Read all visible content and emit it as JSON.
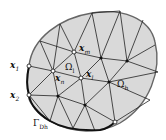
{
  "diagram": {
    "type": "finite-element-triangulation",
    "colors": {
      "fill": "#d9d9d9",
      "edge": "#222222",
      "boundary_outer": "#555555",
      "boundary_dirichlet": "#111111"
    },
    "labels": {
      "x1": {
        "base": "x",
        "sub": "1"
      },
      "x2": {
        "base": "x",
        "sub": "2"
      },
      "xm": {
        "base": "x",
        "sub": "m"
      },
      "xn": {
        "base": "x",
        "sub": "n"
      },
      "xl": {
        "base": "x",
        "sub": "l"
      },
      "omega_l": {
        "base": "Ω",
        "sub": "l"
      },
      "omega_h": {
        "base": "Ω",
        "sub": "h"
      },
      "gamma_dh": {
        "base": "Γ",
        "sub": "Dh"
      }
    },
    "nodes": {
      "open": [
        "x1",
        "x2",
        "xm",
        "xn",
        "xl",
        "bottom-boundary-node"
      ],
      "filled": [
        "interior-1",
        "interior-2",
        "interior-3",
        "interior-4",
        "interior-5"
      ]
    }
  }
}
